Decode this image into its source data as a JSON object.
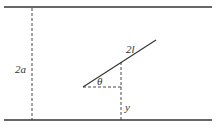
{
  "diagram": {
    "labels": {
      "width": "2a",
      "rod_length": "2l",
      "angle": "θ",
      "height": "y"
    },
    "colors": {
      "line": "#333333",
      "background": "#ffffff"
    },
    "elements": {
      "top_wall": {
        "x1": 4,
        "y1": 7,
        "x2": 212,
        "y2": 7
      },
      "bottom_wall": {
        "x1": 4,
        "y1": 120,
        "x2": 212,
        "y2": 120
      },
      "width_marker": {
        "x": 32,
        "y1": 7,
        "y2": 120
      },
      "rod": {
        "x1": 83,
        "y1": 87,
        "x2": 156,
        "y2": 40
      },
      "angle_baseline": {
        "x1": 83,
        "y1": 87,
        "x2": 121,
        "y2": 87
      },
      "height_marker": {
        "x": 121,
        "y1": 62,
        "y2": 120
      }
    }
  }
}
